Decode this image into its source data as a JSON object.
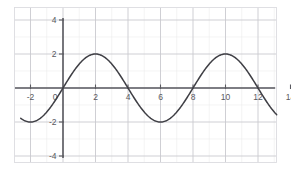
{
  "chart_data": {
    "type": "line",
    "title": "",
    "subtitle": "",
    "xlabel": "",
    "ylabel": "",
    "xlim": [
      -2.6,
      15.2
    ],
    "ylim": [
      -4.9,
      4.6
    ],
    "xticks": [
      -2,
      0,
      2,
      4,
      6,
      8,
      10,
      12,
      14
    ],
    "xtick_labels": [
      "-2",
      "0",
      "2",
      "4",
      "6",
      "8",
      "10",
      "12",
      "14"
    ],
    "yticks": [
      -4,
      -2,
      2,
      4
    ],
    "ytick_labels": [
      "-4",
      "-2",
      "2",
      "4"
    ],
    "grid": true,
    "grid_major_spacing_x": 2,
    "grid_major_spacing_y": 2,
    "legend": null,
    "legend_position": "none",
    "curve_color": "#3f3f45",
    "grid_color": "#c9c9cf",
    "axis_color": "#5a5a60",
    "background_color": "#ffffff",
    "series": [
      {
        "name": "y = 2 sin(pi x / 4)",
        "amplitude": 2,
        "period": 8,
        "phase": 0,
        "x_start": -2.6,
        "x_end": 15.2,
        "key_points": {
          "zeros": [
            0,
            4,
            8,
            12
          ],
          "maxima": [
            {
              "x": 2,
              "y": 2
            },
            {
              "x": 10,
              "y": 2
            }
          ],
          "minima": [
            {
              "x": -2,
              "y": -2
            },
            {
              "x": 6,
              "y": -2
            },
            {
              "x": 14,
              "y": -2
            }
          ]
        },
        "x": [
          -2.6,
          -2.4,
          -2.2,
          -2,
          -1.8,
          -1.6,
          -1.4,
          -1.2,
          -1,
          -0.8,
          -0.6,
          -0.4,
          -0.2,
          0,
          0.2,
          0.4,
          0.6,
          0.8,
          1,
          1.2,
          1.4,
          1.6,
          1.8,
          2,
          2.2,
          2.4,
          2.6,
          2.8,
          3,
          3.2,
          3.4,
          3.6,
          3.8,
          4,
          4.2,
          4.4,
          4.6,
          4.8,
          5,
          5.2,
          5.4,
          5.6,
          5.8,
          6,
          6.2,
          6.4,
          6.6,
          6.8,
          7,
          7.2,
          7.4,
          7.6,
          7.8,
          8,
          8.2,
          8.4,
          8.6,
          8.8,
          9,
          9.2,
          9.4,
          9.6,
          9.8,
          10,
          10.2,
          10.4,
          10.6,
          10.8,
          11,
          11.2,
          11.4,
          11.6,
          11.8,
          12,
          12.2,
          12.4,
          12.6,
          12.8,
          13,
          13.2,
          13.4,
          13.6,
          13.8,
          14,
          14.2,
          14.4,
          14.6,
          14.8,
          15,
          15.2
        ],
        "y": [
          -1.94,
          -1.99,
          -2,
          -2,
          -1.99,
          -1.94,
          -1.87,
          -1.76,
          -1.62,
          -1.46,
          -1.26,
          -1.05,
          -0.81,
          -0.56,
          -0.31,
          -0.05,
          0.21,
          0.47,
          0.71,
          0.94,
          1.14,
          1.32,
          1.47,
          1.59,
          1.69,
          1.76,
          1.81,
          1.82,
          1.82,
          1.78,
          1.71,
          1.62,
          1.5,
          1.36,
          1.2,
          1.02,
          0.83,
          0.63,
          0.41,
          0.19,
          -0.03,
          -0.26,
          -0.48,
          -0.69,
          -0.89,
          -1.08,
          -1.26,
          -1.42,
          -1.56,
          -1.68,
          -1.78,
          -1.86,
          -1.92,
          -1.96,
          -1.99,
          -2,
          -1.99,
          -1.96,
          -1.91,
          -1.84,
          -1.74,
          -1.62,
          -1.48,
          -1.32,
          -1.15,
          -0.96,
          -0.76,
          -0.55,
          -0.33,
          -0.11,
          0.12,
          0.34,
          0.56,
          0.77,
          0.97,
          1.15,
          1.32,
          1.48,
          1.62,
          1.74,
          1.84,
          1.91,
          1.96,
          1.99,
          2,
          1.99,
          1.96,
          1.91,
          1.84,
          1.74
        ]
      }
    ]
  },
  "figure": {
    "axis_origin_label": "0"
  }
}
